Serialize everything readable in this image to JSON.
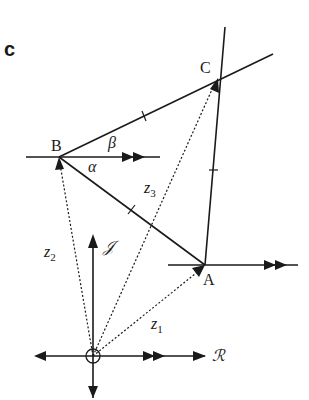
{
  "panel_label": "c",
  "points": {
    "A": "A",
    "B": "B",
    "C": "C"
  },
  "vectors": {
    "z1": {
      "base": "z",
      "sub": "1"
    },
    "z2": {
      "base": "z",
      "sub": "2"
    },
    "z3": {
      "base": "z",
      "sub": "3"
    }
  },
  "angles": {
    "alpha": "α",
    "beta": "β"
  },
  "axes": {
    "real": "ℛ",
    "imag": "𝒥"
  }
}
